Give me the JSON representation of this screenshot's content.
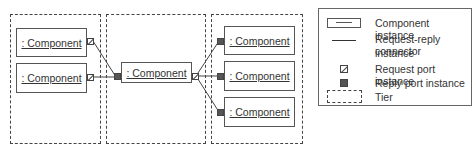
{
  "diagram": {
    "tiers": [
      {
        "id": "tier-1",
        "components": [
          ": Component",
          ": Component"
        ]
      },
      {
        "id": "tier-2",
        "components": [
          ": Component"
        ]
      },
      {
        "id": "tier-3",
        "components": [
          ": Component",
          ": Component",
          ": Component"
        ]
      }
    ],
    "components": {
      "t1_c1": ": Component",
      "t1_c2": ": Component",
      "t2_c1": ": Component",
      "t3_c1": ": Component",
      "t3_c2": ": Component",
      "t3_c3": ": Component"
    },
    "connections": [
      {
        "from": "t1_c1.request_port",
        "to": "t2_c1.reply_port"
      },
      {
        "from": "t1_c2.request_port",
        "to": "t2_c1.reply_port"
      },
      {
        "from": "t2_c1.request_port",
        "to": "t3_c1.reply_port"
      },
      {
        "from": "t2_c1.request_port",
        "to": "t3_c2.reply_port"
      },
      {
        "from": "t2_c1.request_port",
        "to": "t3_c3.reply_port"
      }
    ],
    "colors": {
      "line": "#444444",
      "reply_port_fill": "#555555",
      "background": "#ffffff"
    }
  },
  "legend": {
    "items": [
      {
        "symbol": "component-instance",
        "label": "Component instance"
      },
      {
        "symbol": "connector-line",
        "label": "Request-reply connector instance"
      },
      {
        "symbol": "request-port",
        "label": "Request port instance"
      },
      {
        "symbol": "reply-port",
        "label": "Reply port instance"
      },
      {
        "symbol": "tier",
        "label": "Tier"
      }
    ],
    "labels": {
      "component": "Component instance",
      "connector_line1": "Request-reply connector",
      "connector_line2": "instance",
      "request_port": "Request port instance",
      "reply_port": "Reply port instance",
      "tier": "Tier"
    }
  }
}
